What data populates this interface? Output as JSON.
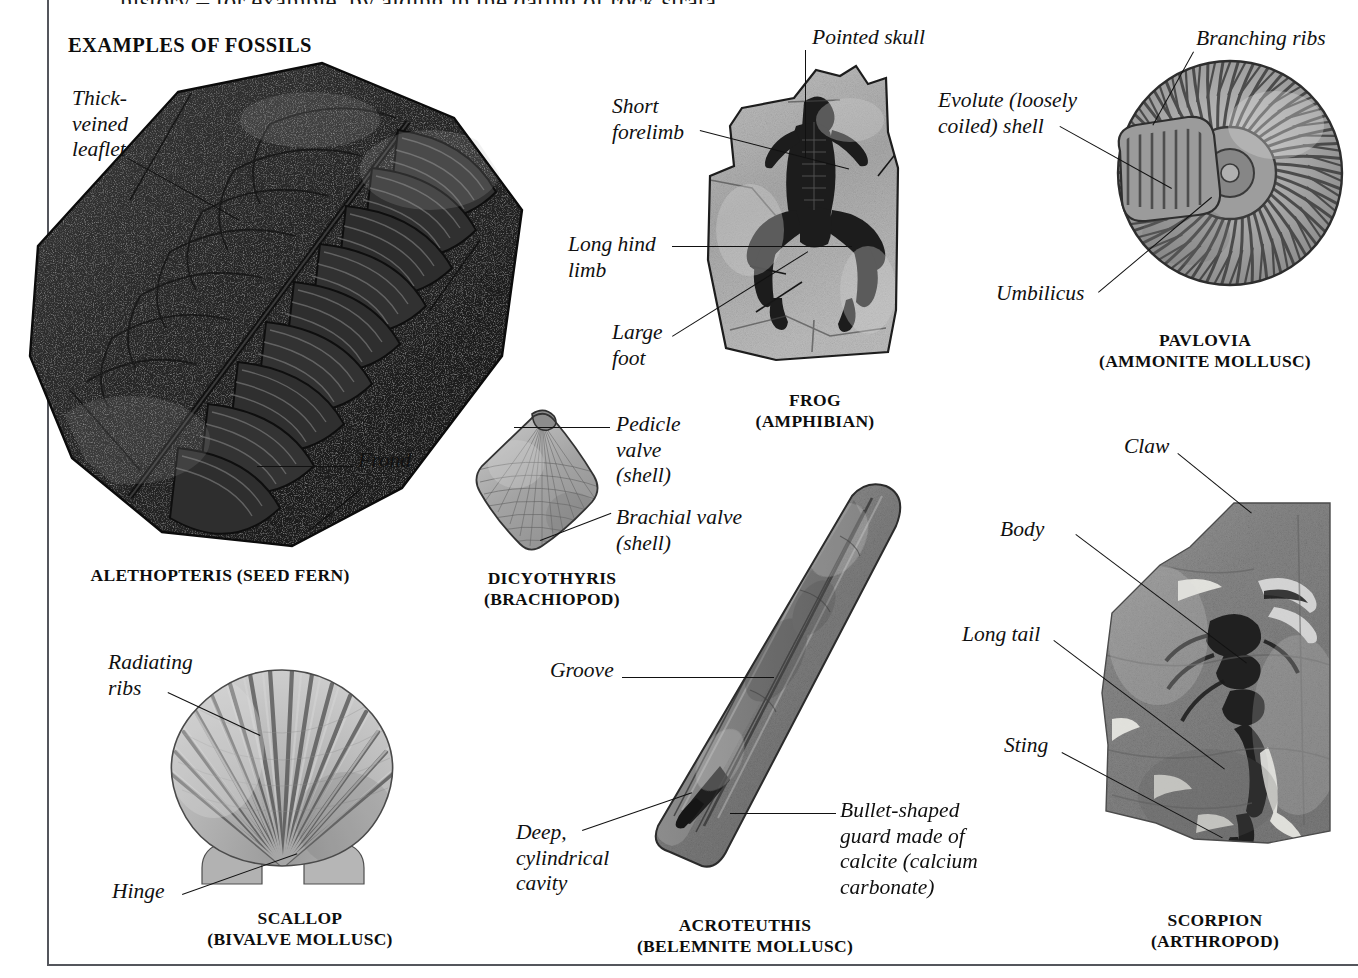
{
  "page": {
    "cut_off_top_line": "history – for example, by aiding in the dating of rock strata.",
    "section_title": "EXAMPLES OF FOSSILS"
  },
  "specimens": [
    {
      "id": "alethopteris",
      "caption": "ALETHOPTERIS (SEED FERN)",
      "labels": [
        {
          "id": "thick-veined-leaflet",
          "text": "Thick-\nveined\nleaflet"
        },
        {
          "id": "frond",
          "text": "Frond"
        }
      ]
    },
    {
      "id": "frog",
      "caption": "FROG\n(AMPHIBIAN)",
      "labels": [
        {
          "id": "pointed-skull",
          "text": "Pointed skull"
        },
        {
          "id": "short-forelimb",
          "text": "Short\nforelimb"
        },
        {
          "id": "long-hind-limb",
          "text": "Long hind\nlimb"
        },
        {
          "id": "large-foot",
          "text": "Large\nfoot"
        }
      ]
    },
    {
      "id": "pavlovia",
      "caption": "PAVLOVIA\n(AMMONITE MOLLUSC)",
      "labels": [
        {
          "id": "branching-ribs",
          "text": "Branching ribs"
        },
        {
          "id": "evolute-shell",
          "text": "Evolute (loosely\ncoiled) shell"
        },
        {
          "id": "umbilicus",
          "text": "Umbilicus"
        }
      ]
    },
    {
      "id": "dicyothyris",
      "caption": "DICYOTHYRIS\n(BRACHIOPOD)",
      "labels": [
        {
          "id": "pedicle-valve",
          "text": "Pedicle\nvalve\n(shell)"
        },
        {
          "id": "brachial-valve",
          "text": "Brachial valve\n(shell)"
        }
      ]
    },
    {
      "id": "scallop",
      "caption": "SCALLOP\n(BIVALVE MOLLUSC)",
      "labels": [
        {
          "id": "radiating-ribs",
          "text": "Radiating\nribs"
        },
        {
          "id": "hinge",
          "text": "Hinge"
        }
      ]
    },
    {
      "id": "acroteuthis",
      "caption": "ACROTEUTHIS\n(BELEMNITE MOLLUSC)",
      "labels": [
        {
          "id": "groove",
          "text": "Groove"
        },
        {
          "id": "deep-cylindrical-cavity",
          "text": "Deep,\ncylindrical\ncavity"
        },
        {
          "id": "bullet-shaped-guard",
          "text": "Bullet-shaped\nguard made of\ncalcite (calcium\ncarbonate)"
        }
      ]
    },
    {
      "id": "scorpion",
      "caption": "SCORPION\n(ARTHROPOD)",
      "labels": [
        {
          "id": "claw",
          "text": "Claw"
        },
        {
          "id": "body",
          "text": "Body"
        },
        {
          "id": "long-tail",
          "text": "Long tail"
        },
        {
          "id": "sting",
          "text": "Sting"
        }
      ]
    }
  ],
  "colors": {
    "rule": "#54565c",
    "text": "#101010",
    "fern_dark": "#272727",
    "rock_mid": "#8a8a8a",
    "rock_light": "#b8b8b8",
    "shell_light": "#c9c9c9"
  }
}
